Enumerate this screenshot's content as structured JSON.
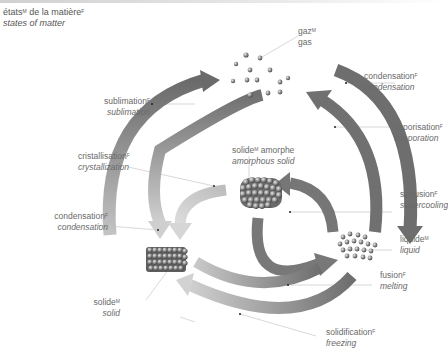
{
  "title": {
    "fr": "états",
    "fr_gender": "M",
    "fr_rest": " de la matière",
    "fr_rest_gender": "F",
    "en": "states of matter"
  },
  "states": {
    "gas": {
      "fr": "gaz",
      "gender": "M",
      "en": "gas"
    },
    "amorphous_solid": {
      "fr": "solide",
      "gender": "M",
      "fr_rest": " amorphe",
      "en": "amorphous solid"
    },
    "liquid": {
      "fr": "liquide",
      "gender": "M",
      "en": "liquid"
    },
    "solid": {
      "fr": "solide",
      "gender": "M",
      "en": "solid"
    }
  },
  "transitions": {
    "condensation_gas_liquid": {
      "fr": "condensation",
      "gender": "F",
      "en": "condensation"
    },
    "vaporisation": {
      "fr": "vaporisation",
      "gender": "F",
      "en": "evaporation"
    },
    "sublimation": {
      "fr": "sublimation",
      "gender": "F",
      "en": "sublimation"
    },
    "crystallisation": {
      "fr": "cristallisation",
      "gender": "F",
      "en": "crystallization"
    },
    "condensation_gas_solid": {
      "fr": "condensation",
      "gender": "F",
      "en": "condensation"
    },
    "supercooling": {
      "fr": "surfusion",
      "gender": "F",
      "en": "supercooling"
    },
    "melting": {
      "fr": "fusion",
      "gender": "F",
      "en": "melting"
    },
    "freezing": {
      "fr": "solidification",
      "gender": "F",
      "en": "freezing"
    }
  },
  "colors": {
    "arrow_dark": "#6e6e6e",
    "arrow_light": "#cfcfcf",
    "text": "#6a6a6a",
    "leader": "#bbbbbb"
  }
}
